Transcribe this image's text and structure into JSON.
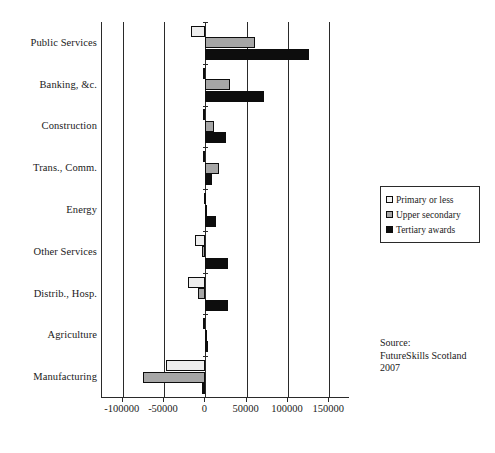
{
  "chart_data": {
    "type": "bar",
    "orientation": "horizontal",
    "title": "",
    "subtitle": "",
    "xlabel": "",
    "ylabel": "",
    "xlim": [
      -125000,
      175000
    ],
    "xticks": [
      -100000,
      -50000,
      0,
      50000,
      100000,
      150000
    ],
    "xtick_labels": [
      "-100000",
      "-50000",
      "0",
      "50000",
      "100000",
      "150000"
    ],
    "grid": true,
    "grid_axis": "x",
    "legend_position": "right",
    "categories": [
      "Public Services",
      "Banking, &c.",
      "Construction",
      "Trans., Comm.",
      "Energy",
      "Other Services",
      "Distrib., Hosp.",
      "Agriculture",
      "Manufacturing"
    ],
    "series": [
      {
        "name": "Primary or less",
        "color": "#eeeeee",
        "values": [
          -17000,
          -2500,
          -2500,
          -3000,
          -1500,
          -13000,
          -21000,
          -2500,
          -48000
        ]
      },
      {
        "name": "Upper secondary",
        "color": "#a6a6a6",
        "values": [
          60000,
          30000,
          11000,
          16000,
          -1000,
          -3500,
          -8500,
          -500,
          -75000
        ]
      },
      {
        "name": "Tertiary awards",
        "color": "#0d0d0d",
        "values": [
          126000,
          71000,
          25000,
          8000,
          13000,
          27000,
          27500,
          1500,
          -4000
        ]
      }
    ]
  },
  "legend": {
    "items": [
      {
        "label": "Primary or less",
        "swatch": "legend-swatch-primary"
      },
      {
        "label": "Upper secondary",
        "swatch": "legend-swatch-upper-secondary"
      },
      {
        "label": "Tertiary awards",
        "swatch": "legend-swatch-tertiary"
      }
    ]
  },
  "source_note": {
    "line1": "Source:",
    "line2": "FutureSkills Scotland",
    "line3": "2007"
  }
}
